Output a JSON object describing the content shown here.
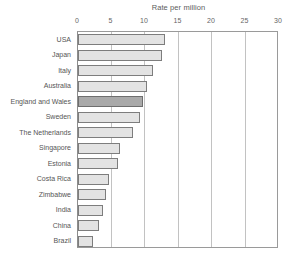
{
  "chart_data": {
    "type": "bar",
    "orientation": "horizontal",
    "title": "Rate per million",
    "xlabel": "",
    "ylabel": "",
    "xlim": [
      0,
      30
    ],
    "xticks": [
      0,
      5,
      10,
      15,
      20,
      25,
      30
    ],
    "xtick_labels": [
      "0",
      "5",
      "10",
      "15",
      "20",
      "25",
      "30"
    ],
    "grid": "vertical",
    "legend": "none",
    "categories": [
      "USA",
      "Japan",
      "Italy",
      "Australia",
      "England and Wales",
      "Sweden",
      "The Netherlands",
      "Singapore",
      "Estonia",
      "Costa Rica",
      "Zimbabwe",
      "India",
      "China",
      "Brazil"
    ],
    "values": [
      13.0,
      12.5,
      11.2,
      10.3,
      9.7,
      9.2,
      8.2,
      6.3,
      6.0,
      4.6,
      4.2,
      3.7,
      3.1,
      2.3
    ],
    "highlight_category": "England and Wales",
    "colors": {
      "bar_fill": "#e3e3e3",
      "bar_border": "#7d7d7d",
      "highlight_fill": "#a9a9a9",
      "highlight_border": "#6e6e6e",
      "gridline": "#c2c2c2",
      "axis": "#9a9a9a",
      "text": "#555555",
      "background": "#ffffff"
    }
  }
}
